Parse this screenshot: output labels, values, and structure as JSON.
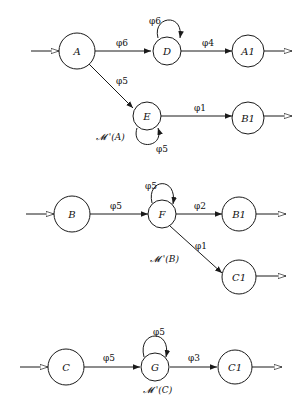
{
  "diagrams": [
    {
      "id": "M_A",
      "caption": "𝓜 '(A)",
      "nodes": [
        {
          "id": "A",
          "label": "A"
        },
        {
          "id": "D",
          "label": "D"
        },
        {
          "id": "A1",
          "label": "A1"
        },
        {
          "id": "E",
          "label": "E"
        },
        {
          "id": "B1",
          "label": "B1"
        }
      ],
      "edges": [
        {
          "from": "A",
          "to": "D",
          "label": "φ6"
        },
        {
          "from": "D",
          "to": "D",
          "label": "φ6"
        },
        {
          "from": "D",
          "to": "A1",
          "label": "φ4"
        },
        {
          "from": "A",
          "to": "E",
          "label": "φ5"
        },
        {
          "from": "E",
          "to": "E",
          "label": "φ5"
        },
        {
          "from": "E",
          "to": "B1",
          "label": "φ1"
        }
      ]
    },
    {
      "id": "M_B",
      "caption": "𝓜 '(B)",
      "nodes": [
        {
          "id": "B",
          "label": "B"
        },
        {
          "id": "F",
          "label": "F"
        },
        {
          "id": "B1",
          "label": "B1"
        },
        {
          "id": "C1",
          "label": "C1"
        }
      ],
      "edges": [
        {
          "from": "B",
          "to": "F",
          "label": "φ5"
        },
        {
          "from": "F",
          "to": "F",
          "label": "φ5"
        },
        {
          "from": "F",
          "to": "B1",
          "label": "φ2"
        },
        {
          "from": "F",
          "to": "C1",
          "label": "φ1"
        }
      ]
    },
    {
      "id": "M_C",
      "caption": "𝓜 '(C)",
      "nodes": [
        {
          "id": "C",
          "label": "C"
        },
        {
          "id": "G",
          "label": "G"
        },
        {
          "id": "C1",
          "label": "C1"
        }
      ],
      "edges": [
        {
          "from": "C",
          "to": "G",
          "label": "φ5"
        },
        {
          "from": "G",
          "to": "G",
          "label": "φ5"
        },
        {
          "from": "G",
          "to": "C1",
          "label": "φ3"
        }
      ]
    }
  ]
}
